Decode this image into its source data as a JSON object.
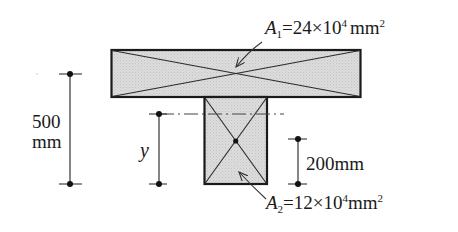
{
  "diagram": {
    "type": "T-section cross-section centroid diagram",
    "colors": {
      "fill": "#d9d9d9",
      "outline": "#1a1a1a",
      "line": "#333333"
    },
    "flange": {
      "area_symbol": "A",
      "area_subscript": "1",
      "area_equals": "=24",
      "area_times": "×",
      "area_base": "10",
      "area_exponent": "4",
      "area_unit": "mm",
      "area_unit_exponent": "2"
    },
    "web": {
      "area_symbol": "A",
      "area_subscript": "2",
      "area_equals": "=12",
      "area_times": "×",
      "area_base": "10",
      "area_exponent": "4",
      "area_unit": "mm",
      "area_unit_exponent": "2"
    },
    "dimensions": {
      "total_height_value": "500",
      "total_height_unit": "mm",
      "centroid_distance_symbol": "y",
      "web_centroid_height": "200mm"
    }
  }
}
